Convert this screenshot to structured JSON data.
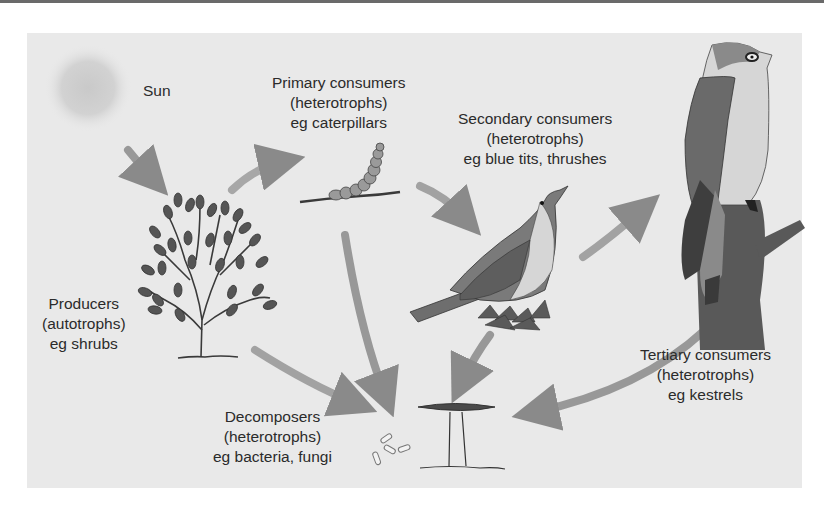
{
  "diagram": {
    "type": "food-chain",
    "colors": {
      "background": "#e9e9e9",
      "arrow": "#8a8a8a",
      "text": "#2b2b2b",
      "dark_fill": "#4a4a4a",
      "mid_fill": "#7a7a7a",
      "light_fill": "#d6d6d6"
    },
    "nodes": {
      "sun": {
        "lines": [
          "Sun"
        ],
        "icon": "sun-icon"
      },
      "producers": {
        "lines": [
          "Producers",
          "(autotrophs)",
          "eg shrubs"
        ],
        "icon": "shrub-icon"
      },
      "primary": {
        "lines": [
          "Primary consumers",
          "(heterotrophs)",
          "eg caterpillars"
        ],
        "icon": "caterpillar-icon"
      },
      "secondary": {
        "lines": [
          "Secondary consumers",
          "(heterotrophs)",
          "eg blue tits, thrushes"
        ],
        "icon": "songbird-icon"
      },
      "tertiary": {
        "lines": [
          "Tertiary consumers",
          "(heterotrophs)",
          "eg kestrels"
        ],
        "icon": "kestrel-icon"
      },
      "decomposers": {
        "lines": [
          "Decomposers",
          "(heterotrophs)",
          "eg bacteria, fungi"
        ],
        "icon": "mushroom-icon"
      }
    },
    "edges": [
      {
        "from": "sun",
        "to": "producers"
      },
      {
        "from": "producers",
        "to": "primary"
      },
      {
        "from": "primary",
        "to": "secondary"
      },
      {
        "from": "secondary",
        "to": "tertiary"
      },
      {
        "from": "producers",
        "to": "decomposers"
      },
      {
        "from": "primary",
        "to": "decomposers"
      },
      {
        "from": "secondary",
        "to": "decomposers"
      },
      {
        "from": "tertiary",
        "to": "decomposers"
      }
    ]
  }
}
